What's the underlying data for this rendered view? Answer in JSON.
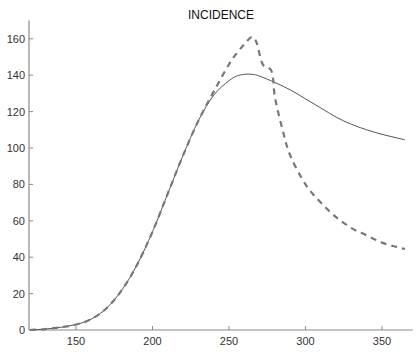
{
  "chart_data": {
    "type": "line",
    "title": "INCIDENCE",
    "xlabel": "",
    "ylabel": "",
    "xlim": [
      120,
      370
    ],
    "ylim": [
      0,
      170
    ],
    "xticks": [
      150,
      200,
      250,
      300,
      350
    ],
    "yticks": [
      0,
      20,
      40,
      60,
      80,
      100,
      120,
      140,
      160
    ],
    "grid": false,
    "legend": null,
    "series": [
      {
        "name": "solid",
        "style": "solid",
        "color": "#555555",
        "x": [
          120,
          130,
          140,
          150,
          160,
          170,
          180,
          190,
          200,
          210,
          220,
          230,
          240,
          250,
          255,
          260,
          265,
          270,
          280,
          290,
          300,
          310,
          320,
          330,
          340,
          350,
          360,
          365
        ],
        "y": [
          0,
          0.5,
          1.5,
          3,
          6,
          12,
          22,
          36,
          54,
          75,
          96,
          115,
          129,
          137,
          139.5,
          140.5,
          140.5,
          139.5,
          136,
          132,
          127,
          122,
          117,
          113,
          110,
          107.5,
          105.5,
          104.5
        ]
      },
      {
        "name": "dashed",
        "style": "dashed",
        "color": "#777777",
        "x": [
          120,
          130,
          140,
          150,
          160,
          170,
          180,
          190,
          200,
          210,
          220,
          230,
          240,
          250,
          255,
          260,
          265,
          268,
          272,
          278,
          280,
          285,
          290,
          300,
          310,
          320,
          330,
          340,
          350,
          360,
          365
        ],
        "y": [
          0,
          0.5,
          1.5,
          3,
          6,
          12,
          22,
          36,
          54,
          75,
          96,
          115,
          131,
          146,
          152,
          157,
          161,
          158,
          146,
          142,
          128,
          110,
          96,
          80,
          70,
          62,
          56,
          52,
          48,
          45.5,
          44.5
        ]
      }
    ]
  }
}
